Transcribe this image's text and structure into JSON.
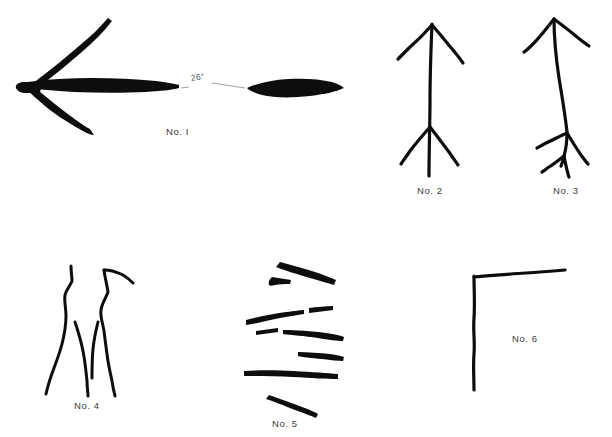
{
  "plate": {
    "background_color": "#ffffff",
    "ink_color": "#0d0d0d",
    "dimension_line_color": "#8a8a90",
    "width": 612,
    "height": 437
  },
  "figures": [
    {
      "id": "no-1",
      "label": "No. I",
      "description": "Thick solid ink arrow pointing left with two long barbs, a broken horizontal shaft, and a dimension callout between the two shaft segments",
      "label_x": 166,
      "label_y": 126,
      "annotation": {
        "text": "26″",
        "x": 191,
        "y": 76
      }
    },
    {
      "id": "no-2",
      "label": "No. 2",
      "description": "Vertical stroke with a chevron / arrowhead at the top and a second barbed chevron near the bottom",
      "label_x": 417,
      "label_y": 185
    },
    {
      "id": "no-3",
      "label": "No. 3",
      "description": "Slightly curved vertical stroke with an inverted V at the top and a three-way branch near the bottom",
      "label_x": 553,
      "label_y": 185
    },
    {
      "id": "no-4",
      "label": "No. 4",
      "description": "Two wavy near-vertical strokes that splay apart at the bottom with two inner branches",
      "label_x": 74,
      "label_y": 400
    },
    {
      "id": "no-5",
      "label": "No. 5",
      "description": "A stack of eight short, roughly horizontal ink dashes of varying length",
      "label_x": 272,
      "label_y": 418
    },
    {
      "id": "no-6",
      "label": "No. 6",
      "description": "A single L-shaped corner mark: one long horizontal stroke meeting one long vertical stroke",
      "label_x": 512,
      "label_y": 333
    }
  ]
}
